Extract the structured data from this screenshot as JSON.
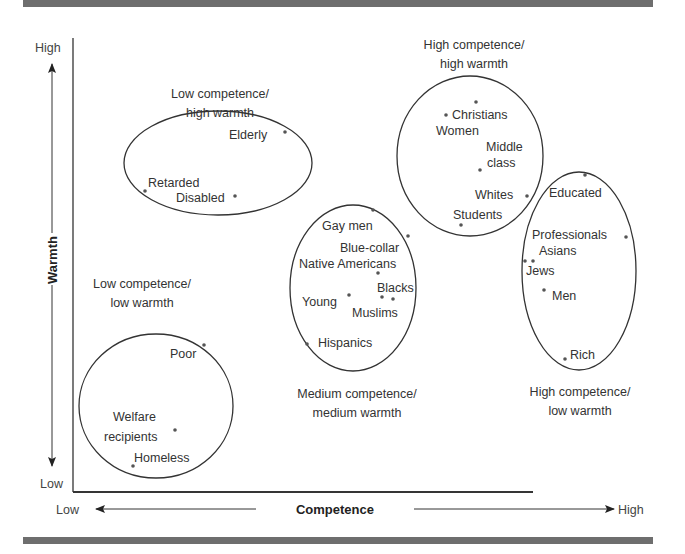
{
  "axes": {
    "x": {
      "title": "Competence",
      "low": "Low",
      "high": "High"
    },
    "y": {
      "title": "Warmth",
      "low": "Low",
      "high": "High"
    }
  },
  "clusters": [
    {
      "id": "low-comp-high-warm",
      "caption": [
        "Low competence/",
        "high warmth"
      ],
      "members": [
        "Elderly",
        "Retarded",
        "Disabled"
      ]
    },
    {
      "id": "high-comp-high-warm",
      "caption": [
        "High competence/",
        "high warmth"
      ],
      "members": [
        "Christians",
        "Women",
        "Middle class",
        "Whites",
        "Students"
      ]
    },
    {
      "id": "medium-comp-medium-warm",
      "caption": [
        "Medium competence/",
        "medium warmth"
      ],
      "members": [
        "Gay men",
        "Blue-collar",
        "Native Americans",
        "Blacks",
        "Young",
        "Muslims",
        "Hispanics"
      ]
    },
    {
      "id": "high-comp-low-warm",
      "caption": [
        "High competence/",
        "low warmth"
      ],
      "members": [
        "Educated",
        "Professionals",
        "Asians",
        "Jews",
        "Men",
        "Rich"
      ]
    },
    {
      "id": "low-comp-low-warm",
      "caption": [
        "Low competence/",
        "low warmth"
      ],
      "members": [
        "Poor",
        "Welfare recipients",
        "Homeless"
      ]
    }
  ],
  "labels": {
    "elderly": "Elderly",
    "retarded": "Retarded",
    "disabled": "Disabled",
    "christians": "Christians",
    "women": "Women",
    "middle": "Middle",
    "class": "class",
    "whites": "Whites",
    "students": "Students",
    "gay_men": "Gay men",
    "blue_collar": "Blue-collar",
    "native_americans": "Native Americans",
    "blacks": "Blacks",
    "young": "Young",
    "muslims": "Muslims",
    "hispanics": "Hispanics",
    "educated": "Educated",
    "professionals": "Professionals",
    "asians": "Asians",
    "jews": "Jews",
    "men": "Men",
    "rich": "Rich",
    "poor": "Poor",
    "welfare": "Welfare",
    "recipients": "recipients",
    "homeless": "Homeless"
  },
  "captions": {
    "lchw_1": "Low competence/",
    "lchw_2": "high warmth",
    "hchw_1": "High competence/",
    "hchw_2": "high warmth",
    "mcmw_1": "Medium competence/",
    "mcmw_2": "medium warmth",
    "hclw_1": "High competence/",
    "hclw_2": "low warmth",
    "lclw_1": "Low competence/",
    "lclw_2": "low warmth"
  }
}
